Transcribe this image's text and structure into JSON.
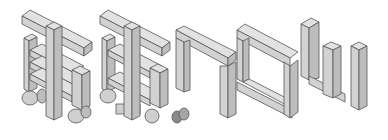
{
  "illustration": {
    "description": "Isometric gray block letters",
    "colors": {
      "background": "#ffffff",
      "top": "#e2e2e2",
      "front": "#d2d2d2",
      "side": "#bdbdbd",
      "stroke": "#555555",
      "cylinder": "#cfcfcf",
      "cylinder_dark": "#8a8a8a"
    },
    "glyphs": [
      {
        "name": "glyph-1",
        "x": 22
      },
      {
        "name": "glyph-2",
        "x": 100
      },
      {
        "name": "glyph-3",
        "x": 175
      },
      {
        "name": "glyph-4",
        "x": 237
      },
      {
        "name": "glyph-5",
        "x": 300
      }
    ]
  }
}
